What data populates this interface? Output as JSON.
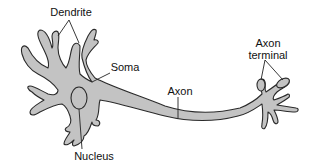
{
  "diagram": {
    "colors": {
      "cell_fill": "#c3c3c3",
      "outline": "#2a2a2a",
      "leader_line": "#222222",
      "background": "#ffffff"
    },
    "labels": {
      "dendrite": "Dendrite",
      "soma": "Soma",
      "axon": "Axon",
      "axon_terminal": "Axon\nterminal",
      "axon_terminal_line1": "Axon",
      "axon_terminal_line2": "terminal",
      "nucleus": "Nucleus"
    }
  }
}
